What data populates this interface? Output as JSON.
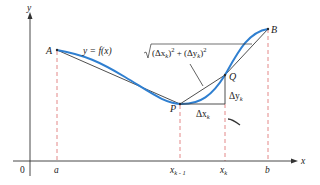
{
  "diagram": {
    "colors": {
      "curve": "#2f7fd0",
      "chord": "#3a3a3a",
      "axes": "#333333",
      "dashed": "#e07a7a",
      "background": "#ffffff"
    },
    "axes": {
      "x_label": "x",
      "y_label": "y",
      "origin_label": "0"
    },
    "points": {
      "A": "A",
      "B": "B",
      "P": "P",
      "Q": "Q"
    },
    "curve_label": "y = f(x)",
    "x_ticks": {
      "a": "a",
      "xk_minus_1_base": "x",
      "xk_minus_1_sub": "k - 1",
      "xk_base": "x",
      "xk_sub": "k",
      "b": "b"
    },
    "annotations": {
      "segment_length_formula": "√((Δx_k)² + (Δy_k)²)",
      "formula_parts": {
        "open": "(Δx",
        "sub1": "k",
        "mid": ")",
        "sup1": "2",
        "plus": " + (Δy",
        "sub2": "k",
        "close": ")",
        "sup2": "2"
      },
      "delta_x_base": "Δx",
      "delta_x_sub": "k",
      "delta_y_base": "Δy",
      "delta_y_sub": "k"
    }
  }
}
